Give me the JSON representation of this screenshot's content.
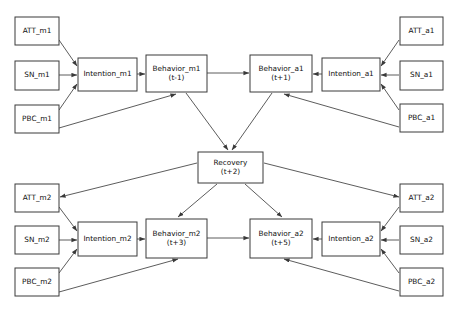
{
  "diagram": {
    "type": "path-diagram",
    "canvas": {
      "width": 458,
      "height": 311
    },
    "style": {
      "box_fill": "#ffffff",
      "box_stroke": "#3a3a3a",
      "edge_stroke": "#4a4a4a",
      "text_color": "#101010",
      "background": "#ffffff"
    },
    "nodes": [
      {
        "id": "att_m1",
        "lines": [
          "ATT_m1"
        ],
        "x": 15,
        "y": 17,
        "w": 44,
        "h": 28
      },
      {
        "id": "sn_m1",
        "lines": [
          "SN_m1"
        ],
        "x": 15,
        "y": 61,
        "w": 44,
        "h": 29
      },
      {
        "id": "pbc_m1",
        "lines": [
          "PBC_m1"
        ],
        "x": 15,
        "y": 105,
        "w": 44,
        "h": 28
      },
      {
        "id": "intention_m1",
        "lines": [
          "Intention_m1"
        ],
        "x": 78,
        "y": 58,
        "w": 59,
        "h": 33
      },
      {
        "id": "behavior_m1",
        "lines": [
          "Behavior_m1",
          "(t-1)"
        ],
        "x": 146,
        "y": 55,
        "w": 61,
        "h": 37
      },
      {
        "id": "behavior_a1",
        "lines": [
          "Behavior_a1",
          "(t+1)"
        ],
        "x": 250,
        "y": 55,
        "w": 62,
        "h": 37
      },
      {
        "id": "intention_a1",
        "lines": [
          "Intention_a1"
        ],
        "x": 322,
        "y": 58,
        "w": 58,
        "h": 33
      },
      {
        "id": "att_a1",
        "lines": [
          "ATT_a1"
        ],
        "x": 400,
        "y": 17,
        "w": 43,
        "h": 28
      },
      {
        "id": "sn_a1",
        "lines": [
          "SN_a1"
        ],
        "x": 400,
        "y": 61,
        "w": 43,
        "h": 29
      },
      {
        "id": "pbc_a1",
        "lines": [
          "PBC_a1"
        ],
        "x": 400,
        "y": 104,
        "w": 43,
        "h": 28
      },
      {
        "id": "recovery",
        "lines": [
          "Recovery",
          "(t+2)"
        ],
        "x": 198,
        "y": 152,
        "w": 65,
        "h": 31
      },
      {
        "id": "att_m2",
        "lines": [
          "ATT_m2"
        ],
        "x": 15,
        "y": 184,
        "w": 44,
        "h": 28
      },
      {
        "id": "sn_m2",
        "lines": [
          "SN_m2"
        ],
        "x": 15,
        "y": 226,
        "w": 44,
        "h": 28
      },
      {
        "id": "pbc_m2",
        "lines": [
          "PBC_m2"
        ],
        "x": 15,
        "y": 268,
        "w": 44,
        "h": 28
      },
      {
        "id": "intention_m2",
        "lines": [
          "Intention_m2"
        ],
        "x": 78,
        "y": 222,
        "w": 59,
        "h": 34
      },
      {
        "id": "behavior_m2",
        "lines": [
          "Behavior_m2",
          "(t+3)"
        ],
        "x": 146,
        "y": 219,
        "w": 61,
        "h": 39
      },
      {
        "id": "behavior_a2",
        "lines": [
          "Behavior_a2",
          "(t+5)"
        ],
        "x": 250,
        "y": 219,
        "w": 62,
        "h": 39
      },
      {
        "id": "intention_a2",
        "lines": [
          "Intention_a2"
        ],
        "x": 322,
        "y": 222,
        "w": 58,
        "h": 34
      },
      {
        "id": "att_a2",
        "lines": [
          "ATT_a2"
        ],
        "x": 400,
        "y": 184,
        "w": 43,
        "h": 28
      },
      {
        "id": "sn_a2",
        "lines": [
          "SN_a2"
        ],
        "x": 400,
        "y": 226,
        "w": 43,
        "h": 28
      },
      {
        "id": "pbc_a2",
        "lines": [
          "PBC_a2"
        ],
        "x": 400,
        "y": 268,
        "w": 43,
        "h": 28
      }
    ],
    "edges": [
      {
        "id": "att_m1-intention_m1",
        "from": "ATT_m1",
        "to": "Intention_m1",
        "x1": 59,
        "y1": 40,
        "x2": 77,
        "y2": 66
      },
      {
        "id": "sn_m1-intention_m1",
        "from": "SN_m1",
        "to": "Intention_m1",
        "x1": 59,
        "y1": 75,
        "x2": 77,
        "y2": 75
      },
      {
        "id": "pbc_m1-intention_m1",
        "from": "PBC_m1",
        "to": "Intention_m1",
        "x1": 59,
        "y1": 110,
        "x2": 77,
        "y2": 84
      },
      {
        "id": "intention_m1-behavior_m1",
        "from": "Intention_m1",
        "to": "Behavior_m1",
        "x1": 137,
        "y1": 74,
        "x2": 145,
        "y2": 74
      },
      {
        "id": "pbc_m1-behavior_m1",
        "from": "PBC_m1",
        "to": "Behavior_m1",
        "x1": 59,
        "y1": 128,
        "x2": 176,
        "y2": 94
      },
      {
        "id": "behavior_m1-behavior_a1",
        "from": "Behavior_m1",
        "to": "Behavior_a1",
        "x1": 207,
        "y1": 73,
        "x2": 249,
        "y2": 73
      },
      {
        "id": "att_a1-intention_a1",
        "from": "ATT_a1",
        "to": "Intention_a1",
        "x1": 399,
        "y1": 40,
        "x2": 381,
        "y2": 66
      },
      {
        "id": "sn_a1-intention_a1",
        "from": "SN_a1",
        "to": "Intention_a1",
        "x1": 399,
        "y1": 75,
        "x2": 381,
        "y2": 75
      },
      {
        "id": "pbc_a1-intention_a1",
        "from": "PBC_a1",
        "to": "Intention_a1",
        "x1": 399,
        "y1": 110,
        "x2": 381,
        "y2": 84
      },
      {
        "id": "intention_a1-behavior_a1",
        "from": "Intention_a1",
        "to": "Behavior_a1",
        "x1": 322,
        "y1": 74,
        "x2": 313,
        "y2": 74
      },
      {
        "id": "pbc_a1-behavior_a1",
        "from": "PBC_a1",
        "to": "Behavior_a1",
        "x1": 399,
        "y1": 127,
        "x2": 284,
        "y2": 94
      },
      {
        "id": "behavior_m1-recovery",
        "from": "Behavior_m1",
        "to": "Recovery",
        "x1": 186,
        "y1": 93,
        "x2": 228,
        "y2": 150
      },
      {
        "id": "behavior_a1-recovery",
        "from": "Behavior_a1",
        "to": "Recovery",
        "x1": 272,
        "y1": 93,
        "x2": 232,
        "y2": 150
      },
      {
        "id": "recovery-att_m2",
        "from": "Recovery",
        "to": "ATT_m2",
        "x1": 197,
        "y1": 163,
        "x2": 60,
        "y2": 197
      },
      {
        "id": "recovery-att_a2",
        "from": "Recovery",
        "to": "ATT_a2",
        "x1": 264,
        "y1": 163,
        "x2": 399,
        "y2": 197
      },
      {
        "id": "recovery-behavior_m2",
        "from": "Recovery",
        "to": "Behavior_m2",
        "x1": 217,
        "y1": 184,
        "x2": 178,
        "y2": 217
      },
      {
        "id": "recovery-behavior_a2",
        "from": "Recovery",
        "to": "Behavior_a2",
        "x1": 245,
        "y1": 184,
        "x2": 282,
        "y2": 217
      },
      {
        "id": "att_m2-intention_m2",
        "from": "ATT_m2",
        "to": "Intention_m2",
        "x1": 59,
        "y1": 207,
        "x2": 77,
        "y2": 231
      },
      {
        "id": "sn_m2-intention_m2",
        "from": "SN_m2",
        "to": "Intention_m2",
        "x1": 59,
        "y1": 240,
        "x2": 77,
        "y2": 240
      },
      {
        "id": "pbc_m2-intention_m2",
        "from": "PBC_m2",
        "to": "Intention_m2",
        "x1": 59,
        "y1": 273,
        "x2": 77,
        "y2": 249
      },
      {
        "id": "intention_m2-behavior_m2",
        "from": "Intention_m2",
        "to": "Behavior_m2",
        "x1": 137,
        "y1": 239,
        "x2": 145,
        "y2": 239
      },
      {
        "id": "pbc_m2-behavior_m2",
        "from": "PBC_m2",
        "to": "Behavior_m2",
        "x1": 59,
        "y1": 292,
        "x2": 178,
        "y2": 259
      },
      {
        "id": "behavior_m2-behavior_a2",
        "from": "Behavior_m2",
        "to": "Behavior_a2",
        "x1": 207,
        "y1": 238,
        "x2": 249,
        "y2": 238
      },
      {
        "id": "att_a2-intention_a2",
        "from": "ATT_a2",
        "to": "Intention_a2",
        "x1": 399,
        "y1": 207,
        "x2": 381,
        "y2": 231
      },
      {
        "id": "sn_a2-intention_a2",
        "from": "SN_a2",
        "to": "Intention_a2",
        "x1": 399,
        "y1": 240,
        "x2": 381,
        "y2": 240
      },
      {
        "id": "pbc_a2-intention_a2",
        "from": "PBC_a2",
        "to": "Intention_a2",
        "x1": 399,
        "y1": 273,
        "x2": 381,
        "y2": 249
      },
      {
        "id": "intention_a2-behavior_a2",
        "from": "Intention_a2",
        "to": "Behavior_a2",
        "x1": 322,
        "y1": 239,
        "x2": 313,
        "y2": 239
      },
      {
        "id": "pbc_a2-behavior_a2",
        "from": "PBC_a2",
        "to": "Behavior_a2",
        "x1": 399,
        "y1": 291,
        "x2": 284,
        "y2": 259
      }
    ]
  }
}
